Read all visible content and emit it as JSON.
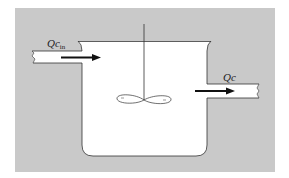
{
  "diagram": {
    "type": "continuous stirred tank reactor",
    "colors": {
      "background": "#ffffff",
      "panel": "#c9c9c9",
      "fluid": "#ffffff",
      "stroke": "#333333",
      "arrow": "#111111"
    },
    "inlet": {
      "label_main": "Qc",
      "label_sub": "in",
      "arrow_direction": "right"
    },
    "outlet": {
      "label_main": "Qc",
      "arrow_direction": "right"
    },
    "components": [
      "tank",
      "stirrer-shaft",
      "impeller",
      "inlet-pipe",
      "outlet-pipe"
    ]
  }
}
